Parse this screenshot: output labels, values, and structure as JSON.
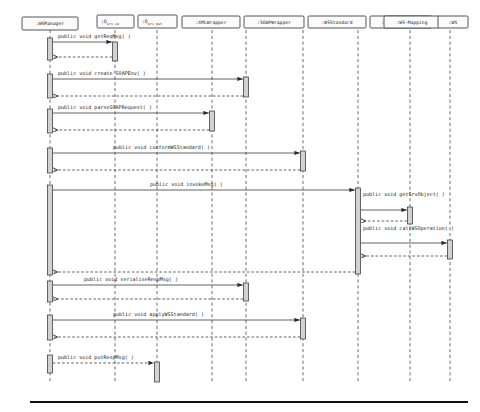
{
  "diagram": {
    "type": "uml-sequence-diagram",
    "colors": {
      "background": "#ffffff",
      "line": "#3a3a3a",
      "activation_fill": "#d2d2d2",
      "box_fill": "#fbfbfb",
      "box_stroke": "#2b2b2b",
      "text": "#1a1a1a",
      "rule": "#111111"
    },
    "lifelines": [
      {
        "id": "wsmanager",
        "label": ":WSManager",
        "sub": "",
        "x": 50,
        "box_x": 22,
        "box_w": 56,
        "box_y": 17,
        "box_h": 13
      },
      {
        "id": "qsrvin",
        "label": ":Q",
        "sub": "srv_in",
        "x": 115,
        "box_x": 97,
        "box_w": 37,
        "box_y": 15,
        "box_h": 13
      },
      {
        "id": "qsrvout",
        "label": ":Q",
        "sub": "srv_out",
        "x": 157,
        "box_x": 138,
        "box_w": 39,
        "box_y": 15,
        "box_h": 13
      },
      {
        "id": "xmlwrapper",
        "label": ":XMLWrapper",
        "sub": "",
        "x": 212,
        "box_x": 182,
        "box_w": 58,
        "box_y": 16,
        "box_h": 12
      },
      {
        "id": "soapwrapper",
        "label": ":SOAPWrapper",
        "sub": "",
        "x": 246,
        "box_x": 244,
        "box_w": 60,
        "box_y": 16,
        "box_h": 12
      },
      {
        "id": "wsstandard",
        "label": ":WSStandard",
        "sub": "",
        "x": 303,
        "box_x": 308,
        "box_w": 58,
        "box_y": 16,
        "box_h": 12
      },
      {
        "id": "serviceloader",
        "label": ":ServiceLoader",
        "sub": "",
        "x": 358,
        "box_x": 370,
        "box_w": 62,
        "box_y": 16,
        "box_h": 12
      },
      {
        "id": "wsmapping",
        "label": ":WS-Mapping",
        "sub": "",
        "x": 410,
        "box_x": 384,
        "box_w": 56,
        "box_y": 16,
        "box_h": 12
      },
      {
        "id": "ws",
        "label": ":WS",
        "sub": "",
        "x": 450,
        "box_x": 438,
        "box_w": 30,
        "box_y": 16,
        "box_h": 12
      }
    ],
    "lifeline_top": 30,
    "lifeline_bottom": 382,
    "messages": [
      {
        "n": 1,
        "label": "public void getReqMsg( )",
        "from": "wsmanager",
        "to": "qsrvin",
        "y": 42,
        "label_x": 58,
        "label_y": 38,
        "kind": "call"
      },
      {
        "n": 2,
        "label": "public void create SOAPEnv( )",
        "from": "wsmanager",
        "to": "soapwrapper",
        "y": 79,
        "label_x": 58,
        "label_y": 75,
        "kind": "call"
      },
      {
        "n": 3,
        "label": "public void parseSOAPRequest( )",
        "from": "wsmanager",
        "to": "xmlwrapper",
        "y": 113,
        "label_x": 58,
        "label_y": 109,
        "kind": "call"
      },
      {
        "n": 4,
        "label": "public void conformWSStandard( )",
        "from": "wsmanager",
        "to": "wsstandard",
        "y": 153,
        "label_x": 113,
        "label_y": 149,
        "kind": "call"
      },
      {
        "n": 5,
        "label": "public void invokeMsg( )",
        "from": "wsmanager",
        "to": "serviceloader",
        "y": 190,
        "label_x": 150,
        "label_y": 186,
        "kind": "call"
      },
      {
        "n": 6,
        "label": "public void getSrvObject( )",
        "from": "serviceloader",
        "to": "wsmapping",
        "y": 210,
        "label_x": 363,
        "label_y": 196,
        "kind": "call"
      },
      {
        "n": 7,
        "label": "public void callWSOperation( )",
        "from": "serviceloader",
        "to": "ws",
        "y": 243,
        "label_x": 363,
        "label_y": 230,
        "kind": "call"
      },
      {
        "n": 8,
        "label": "public void serialiseRespMsg( )",
        "from": "wsmanager",
        "to": "soapwrapper",
        "y": 285,
        "label_x": 84,
        "label_y": 281,
        "kind": "call"
      },
      {
        "n": 9,
        "label": "public void applyWSStandard( )",
        "from": "wsmanager",
        "to": "wsstandard",
        "y": 320,
        "label_x": 113,
        "label_y": 316,
        "kind": "call"
      },
      {
        "n": 10,
        "label": "public void putRespMsg( )",
        "from": "wsmanager",
        "to": "qsrvout",
        "y": 363,
        "label_x": 58,
        "label_y": 359,
        "kind": "return-dashed"
      }
    ],
    "returns": [
      {
        "n": 1,
        "from": "qsrvin",
        "to": "wsmanager",
        "y": 57
      },
      {
        "n": 2,
        "from": "soapwrapper",
        "to": "wsmanager",
        "y": 96
      },
      {
        "n": 3,
        "from": "xmlwrapper",
        "to": "wsmanager",
        "y": 130
      },
      {
        "n": 4,
        "from": "wsstandard",
        "to": "wsmanager",
        "y": 170
      },
      {
        "n": 6,
        "from": "wsmapping",
        "to": "serviceloader",
        "y": 221
      },
      {
        "n": 7,
        "from": "ws",
        "to": "serviceloader",
        "y": 256
      },
      {
        "n": 5,
        "from": "serviceloader",
        "to": "wsmanager",
        "y": 272
      },
      {
        "n": 8,
        "from": "soapwrapper",
        "to": "wsmanager",
        "y": 299
      },
      {
        "n": 9,
        "from": "wsstandard",
        "to": "wsmanager",
        "y": 337
      }
    ],
    "activations": [
      {
        "id": "a-wsmanager-1",
        "lifeline": "wsmanager",
        "y": 38,
        "h": 22,
        "w": 5
      },
      {
        "id": "a-qsrvin-1",
        "lifeline": "qsrvin",
        "y": 42,
        "h": 19,
        "w": 5
      },
      {
        "id": "a-wsmanager-2",
        "lifeline": "wsmanager",
        "y": 74,
        "h": 24,
        "w": 5
      },
      {
        "id": "a-soapwrap-1",
        "lifeline": "soapwrapper",
        "y": 77,
        "h": 20,
        "w": 5
      },
      {
        "id": "a-wsmanager-3",
        "lifeline": "wsmanager",
        "y": 109,
        "h": 24,
        "w": 5
      },
      {
        "id": "a-xmlwrap-1",
        "lifeline": "xmlwrapper",
        "y": 111,
        "h": 20,
        "w": 5
      },
      {
        "id": "a-wsmanager-4",
        "lifeline": "wsmanager",
        "y": 148,
        "h": 25,
        "w": 5
      },
      {
        "id": "a-wsstd-1",
        "lifeline": "wsstandard",
        "y": 151,
        "h": 20,
        "w": 5
      },
      {
        "id": "a-wsmanager-5",
        "lifeline": "wsmanager",
        "y": 185,
        "h": 90,
        "w": 5
      },
      {
        "id": "a-srvloader-1",
        "lifeline": "serviceloader",
        "y": 188,
        "h": 86,
        "w": 5
      },
      {
        "id": "a-wsmapping-1",
        "lifeline": "wsmapping",
        "y": 207,
        "h": 17,
        "w": 5
      },
      {
        "id": "a-ws-1",
        "lifeline": "ws",
        "y": 240,
        "h": 19,
        "w": 5
      },
      {
        "id": "a-wsmanager-6",
        "lifeline": "wsmanager",
        "y": 281,
        "h": 21,
        "w": 5
      },
      {
        "id": "a-soapwrap-2",
        "lifeline": "soapwrapper",
        "y": 283,
        "h": 18,
        "w": 5
      },
      {
        "id": "a-wsmanager-7",
        "lifeline": "wsmanager",
        "y": 315,
        "h": 25,
        "w": 5
      },
      {
        "id": "a-wsstd-2",
        "lifeline": "wsstandard",
        "y": 318,
        "h": 21,
        "w": 5
      },
      {
        "id": "a-wsmanager-8",
        "lifeline": "wsmanager",
        "y": 355,
        "h": 18,
        "w": 5
      },
      {
        "id": "a-qsrvout-1",
        "lifeline": "qsrvout",
        "y": 362,
        "h": 20,
        "w": 5
      }
    ],
    "bottom_rule": {
      "x1": 30,
      "x2": 468,
      "y": 402
    }
  }
}
